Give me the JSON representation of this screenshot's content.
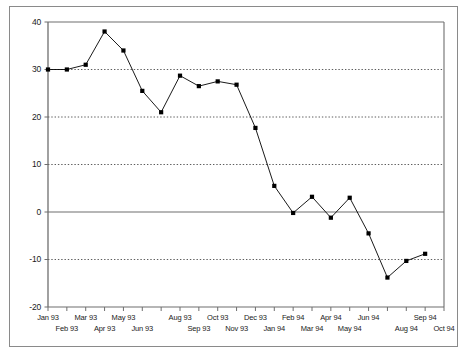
{
  "chart_data": {
    "type": "line",
    "title": "",
    "subtitle": "",
    "xlabel": "",
    "ylabel": "",
    "grid": true,
    "legend": "none",
    "ylim": [
      -20,
      40
    ],
    "yticks": [
      40,
      30,
      20,
      10,
      0,
      -10,
      -20
    ],
    "ytick_labels": [
      "40",
      "30",
      "20",
      "10",
      "0",
      "-10",
      "-20"
    ],
    "zero_line": 0,
    "categories": [
      "Jan 93",
      "Feb 93",
      "Mar 93",
      "Apr 93",
      "May 93",
      "Jun 93",
      "Jul 93",
      "Aug 93",
      "Sep 93",
      "Oct 93",
      "Nov 93",
      "Dec 93",
      "Jan 94",
      "Feb 94",
      "Mar 94",
      "Apr 94",
      "May 94",
      "Jun 94",
      "Jul 94",
      "Aug 94",
      "Sep 94",
      "Oct 94"
    ],
    "xtick_labels_upper": [
      "Jan 93",
      "Mar 93",
      "May 93",
      "Aug 93",
      "Oct 93",
      "Dec 93",
      "Feb 94",
      "Apr 94",
      "Jun 94",
      "Sep 94"
    ],
    "xtick_labels_lower": [
      "Feb 93",
      "Apr 93",
      "Jun 93",
      "Sep 93",
      "Nov 93",
      "Jan 94",
      "Mar 94",
      "May 94",
      "Aug 94",
      "Oct 94"
    ],
    "values": [
      30.0,
      30.0,
      31.0,
      38.0,
      34.0,
      25.5,
      21.0,
      28.7,
      26.5,
      27.5,
      26.8,
      17.7,
      5.5,
      -0.2,
      3.2,
      -1.2,
      3.0,
      -4.5,
      -13.8,
      -10.3,
      -8.8,
      null
    ],
    "series": [
      {
        "name": "series-1",
        "marker": "square",
        "color": "#000000",
        "points": [
          {
            "x": "Jan 93",
            "y": 30.0
          },
          {
            "x": "Feb 93",
            "y": 30.0
          },
          {
            "x": "Mar 93",
            "y": 31.0
          },
          {
            "x": "Apr 93",
            "y": 38.0
          },
          {
            "x": "May 93",
            "y": 34.0
          },
          {
            "x": "Jun 93",
            "y": 25.5
          },
          {
            "x": "Jul 93",
            "y": 21.0
          },
          {
            "x": "Aug 93",
            "y": 28.7
          },
          {
            "x": "Sep 93",
            "y": 26.5
          },
          {
            "x": "Oct 93",
            "y": 27.5
          },
          {
            "x": "Nov 93",
            "y": 26.8
          },
          {
            "x": "Dec 93",
            "y": 17.7
          },
          {
            "x": "Jan 94",
            "y": 5.5
          },
          {
            "x": "Feb 94",
            "y": -0.2
          },
          {
            "x": "Mar 94",
            "y": 3.2
          },
          {
            "x": "Apr 94",
            "y": -1.2
          },
          {
            "x": "May 94",
            "y": 3.0
          },
          {
            "x": "Jun 94",
            "y": -4.5
          },
          {
            "x": "Jul 94",
            "y": -13.8
          },
          {
            "x": "Aug 94",
            "y": -10.3
          },
          {
            "x": "Sep 94",
            "y": -8.8
          }
        ]
      }
    ],
    "colors": {
      "line": "#000000",
      "marker": "#000000",
      "axis": "#6e6e6e",
      "grid": "#333333",
      "frame": "#8a8a8a",
      "background": "#ffffff"
    }
  }
}
